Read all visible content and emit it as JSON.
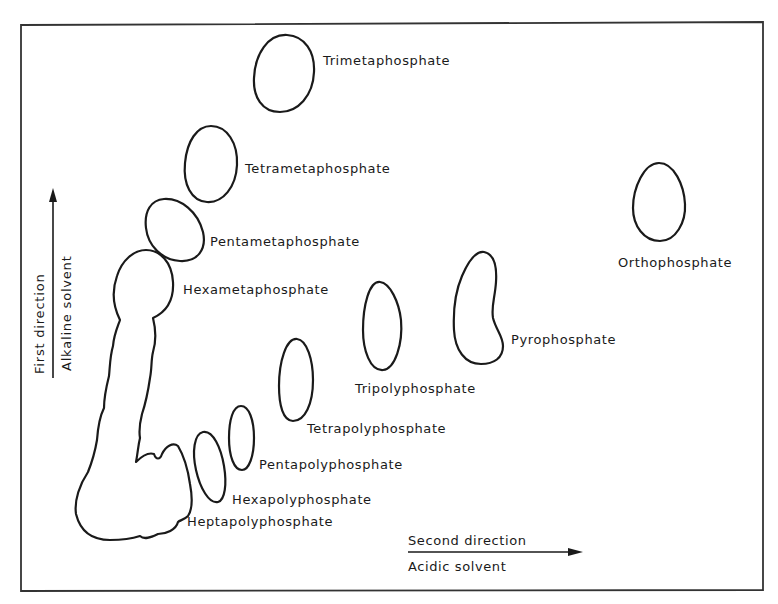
{
  "figure": {
    "type": "two-dimensional paper chromatogram of condensed phosphates",
    "axes": {
      "vertical": {
        "label_top": "First direction",
        "label_bottom": "Alkaline solvent",
        "arrow_direction": "up"
      },
      "horizontal": {
        "label_top": "Second direction",
        "label_bottom": "Acidic solvent",
        "arrow_direction": "right"
      }
    },
    "spots": [
      {
        "id": "trimetaphosphate",
        "label": "Trimetaphosphate"
      },
      {
        "id": "tetrametaphosphate",
        "label": "Tetrametaphosphate"
      },
      {
        "id": "pentametaphosphate",
        "label": "Pentametaphosphate"
      },
      {
        "id": "hexametaphosphate",
        "label": "Hexametaphosphate"
      },
      {
        "id": "orthophosphate",
        "label": "Orthophosphate"
      },
      {
        "id": "pyrophosphate",
        "label": "Pyrophosphate"
      },
      {
        "id": "tripolyphosphate",
        "label": "Tripolyphosphate"
      },
      {
        "id": "tetrapolyphosphate",
        "label": "Tetrapolyphosphate"
      },
      {
        "id": "pentapolyphosphate",
        "label": "Pentapolyphosphate"
      },
      {
        "id": "hexapolyphosphate",
        "label": "Hexapolyphosphate"
      },
      {
        "id": "heptapolyphosphate",
        "label": "Heptapolyphosphate"
      }
    ],
    "colors": {
      "ink": "#1a1a1a",
      "frame": "#333333",
      "background": "#ffffff"
    }
  }
}
